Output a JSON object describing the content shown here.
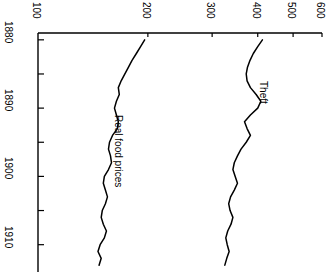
{
  "chart_data": {
    "type": "line",
    "title": "",
    "orientation": "rotated-90",
    "xlabel": "",
    "ylabel": "",
    "scale": "log",
    "xlim": [
      1879,
      1914
    ],
    "ylim": [
      100,
      600
    ],
    "grid": false,
    "legend_position": "inline-annotation",
    "value_ticks": [
      100,
      200,
      300,
      400,
      500,
      600
    ],
    "value_tick_labels": [
      "100",
      "200",
      "300",
      "400",
      "500",
      "600"
    ],
    "year_ticks": [
      1880,
      1885,
      1890,
      1895,
      1900,
      1905,
      1910
    ],
    "year_tick_labels": [
      "1880",
      "",
      "1890",
      "",
      "1900",
      "",
      "1910"
    ],
    "year_labels_shown": [
      "1880",
      "1890",
      "1900",
      "1910"
    ],
    "x": [
      1880,
      1881,
      1882,
      1883,
      1884,
      1885,
      1886,
      1887,
      1888,
      1889,
      1890,
      1891,
      1892,
      1893,
      1894,
      1895,
      1896,
      1897,
      1898,
      1899,
      1900,
      1901,
      1902,
      1903,
      1904,
      1905,
      1906,
      1907,
      1908,
      1909,
      1910,
      1911,
      1912,
      1913
    ],
    "series": [
      {
        "name": "Real food prices",
        "color": "#000000",
        "values": [
          196,
          191,
          186,
          181,
          177,
          173,
          169,
          166,
          167,
          164,
          162,
          164,
          166,
          165,
          160,
          157,
          156,
          158,
          159,
          156,
          152,
          151,
          153,
          155,
          153,
          150,
          149,
          151,
          154,
          152,
          148,
          146,
          149,
          147
        ]
      },
      {
        "name": "Theft",
        "color": "#000000",
        "values": [
          412,
          400,
          389,
          381,
          375,
          372,
          374,
          382,
          396,
          408,
          400,
          382,
          368,
          374,
          382,
          372,
          360,
          352,
          345,
          342,
          347,
          352,
          345,
          337,
          333,
          336,
          342,
          338,
          331,
          327,
          330,
          334,
          329,
          325
        ]
      }
    ],
    "annotations": [
      {
        "text": "Real food prices",
        "x_value": 1891,
        "y_value": 172
      },
      {
        "text": "Theft",
        "x_value": 1886,
        "y_value": 430
      }
    ]
  },
  "axes": {
    "value_axis_name": "value-axis-top",
    "year_axis_name": "year-axis-left"
  }
}
